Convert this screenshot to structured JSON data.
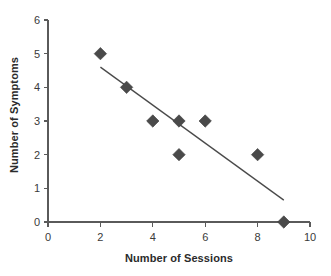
{
  "chart_data": {
    "type": "scatter",
    "title": "",
    "xlabel": "Number of Sessions",
    "ylabel": "Number of Symptoms",
    "xlim": [
      0,
      10
    ],
    "ylim": [
      0,
      6
    ],
    "xticks": [
      "0",
      "2",
      "4",
      "6",
      "8",
      "10"
    ],
    "xtick_values": [
      0,
      2,
      4,
      6,
      8,
      10
    ],
    "yticks": [
      "0",
      "1",
      "2",
      "3",
      "4",
      "5",
      "6"
    ],
    "ytick_values": [
      0,
      1,
      2,
      3,
      4,
      5,
      6
    ],
    "grid": false,
    "legend": null,
    "marker_shape": "diamond",
    "marker_color": "#4a4a4a",
    "trendline_color": "#4a4a4a",
    "points": [
      {
        "x": 2,
        "y": 5
      },
      {
        "x": 3,
        "y": 4
      },
      {
        "x": 4,
        "y": 3
      },
      {
        "x": 5,
        "y": 3
      },
      {
        "x": 5,
        "y": 2
      },
      {
        "x": 6,
        "y": 3
      },
      {
        "x": 8,
        "y": 2
      },
      {
        "x": 9,
        "y": 0
      }
    ],
    "series": [
      {
        "name": "Symptoms vs Sessions",
        "x": [
          2,
          3,
          4,
          5,
          5,
          6,
          8,
          9
        ],
        "values": [
          5,
          4,
          3,
          3,
          2,
          3,
          2,
          0
        ]
      }
    ],
    "trendline": {
      "type": "linear",
      "x_start": 2.0,
      "y_start": 4.6,
      "x_end": 9.0,
      "y_end": 0.65
    },
    "axis_color": "#5a5a5a",
    "background": "#ffffff"
  }
}
